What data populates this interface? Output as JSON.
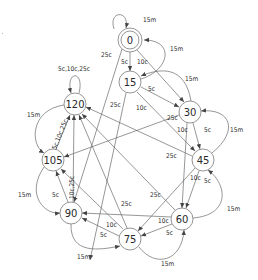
{
  "diagram": {
    "type": "state-machine",
    "nodes": [
      {
        "id": "0",
        "label": "0",
        "x": 130,
        "y": 40,
        "accepting": true
      },
      {
        "id": "15",
        "label": "15",
        "x": 130,
        "y": 82
      },
      {
        "id": "30",
        "label": "30",
        "x": 190,
        "y": 112
      },
      {
        "id": "45",
        "label": "45",
        "x": 203,
        "y": 160
      },
      {
        "id": "60",
        "label": "60",
        "x": 182,
        "y": 219
      },
      {
        "id": "75",
        "label": "75",
        "x": 130,
        "y": 239
      },
      {
        "id": "90",
        "label": "90",
        "x": 71,
        "y": 213
      },
      {
        "id": "105",
        "label": "105",
        "x": 53,
        "y": 160
      },
      {
        "id": "120",
        "label": "120",
        "x": 75,
        "y": 104
      }
    ],
    "edge_labels": {
      "l0_self": "15m",
      "l15_0": "15m",
      "l0_15": "5c",
      "l0_30": "10c",
      "l0_90": "25c",
      "l30_15": "15m",
      "l15_30": "5c",
      "l15_45": "10c",
      "l15_105": "25c",
      "l120_self": "5c,10c,25c",
      "l120_105": "15m",
      "l105_120": "5c,10c,25c",
      "l45_30": "15m",
      "l30_45": "5c",
      "l30_60": "10c",
      "l30_105": "25c",
      "l45_120": "25c",
      "l45_60": "5c",
      "l45_75": "10c",
      "l60_45": "15m",
      "l60_120": "25c",
      "l60_75": "5c",
      "l60_90": "10c",
      "l75_60": "15m",
      "l75_90": "5c",
      "l75_105": "10c",
      "l75_120": "25c",
      "l90_75": "15m",
      "l90_105": "5c",
      "l90_120": "10c,25c",
      "l105_90": "15m"
    }
  }
}
